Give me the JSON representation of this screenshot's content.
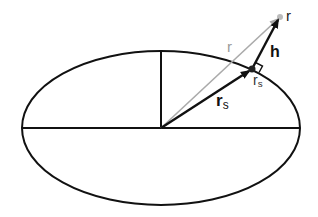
{
  "diagram": {
    "ellipse": {
      "cx": 161,
      "cy": 128,
      "rx": 139,
      "ry": 77
    },
    "labels": {
      "r_vector": "r",
      "r_endpoint": "r",
      "h_vector": "h",
      "rs_vector_main": "r",
      "rs_vector_sub": "s",
      "rs_point_main": "r",
      "rs_point_sub": "s"
    },
    "points": {
      "origin": [
        161,
        128
      ],
      "surface_point": [
        252,
        69
      ],
      "target_point": [
        280,
        17
      ]
    },
    "colors": {
      "line": "#111111",
      "gray_vector": "#9a9a9a"
    }
  }
}
